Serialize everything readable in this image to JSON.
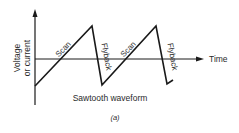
{
  "figure": {
    "title": "Sawtooth waveform",
    "sublabel": "(a)",
    "y_axis_label_line1": "Voltage",
    "y_axis_label_line2": "or current",
    "x_axis_label": "Time",
    "segments": [
      {
        "label": "Scan"
      },
      {
        "label": "Flyback"
      },
      {
        "label": "Scan"
      },
      {
        "label": "Flyback"
      }
    ],
    "colors": {
      "line": "#1a1a1a",
      "text": "#2a2a2a",
      "background": "#ffffff"
    }
  }
}
